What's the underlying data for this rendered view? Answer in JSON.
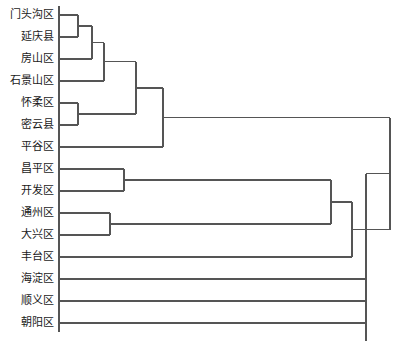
{
  "chart_data": {
    "type": "dendrogram",
    "title": "",
    "subtitle": "",
    "xlabel": "",
    "ylabel": "",
    "orientation": "horizontal-leaves-left",
    "grid": false,
    "legend": null,
    "axis_visible": false,
    "line_color": "#555555",
    "background_color": "#ffffff",
    "leaf_count": 15,
    "leaves": [
      {
        "index": 0,
        "label": "门头沟区",
        "y": 15
      },
      {
        "index": 1,
        "label": "延庆县",
        "y": 37
      },
      {
        "index": 2,
        "label": "房山区",
        "y": 59
      },
      {
        "index": 3,
        "label": "石景山区",
        "y": 81
      },
      {
        "index": 4,
        "label": "怀柔区",
        "y": 103
      },
      {
        "index": 5,
        "label": "密云县",
        "y": 125
      },
      {
        "index": 6,
        "label": "平谷区",
        "y": 147
      },
      {
        "index": 7,
        "label": "昌平区",
        "y": 169
      },
      {
        "index": 8,
        "label": "开发区",
        "y": 191
      },
      {
        "index": 9,
        "label": "通州区",
        "y": 213
      },
      {
        "index": 10,
        "label": "大兴区",
        "y": 235
      },
      {
        "index": 11,
        "label": "丰台区",
        "y": 257
      },
      {
        "index": 12,
        "label": "海淀区",
        "y": 279
      },
      {
        "index": 13,
        "label": "顺义区",
        "y": 301
      },
      {
        "index": 14,
        "label": "朝阳区",
        "y": 323
      },
      {
        "index": 15,
        "label": "西城区",
        "y": 345
      },
      {
        "index": 16,
        "label": "东城区",
        "y": 367
      }
    ],
    "leaf_x": 59,
    "merges": [
      {
        "id": "m1",
        "label": "门头沟区 + 延庆县",
        "x": 78,
        "y1": 15,
        "y2": 37
      },
      {
        "id": "m2",
        "label": "m1 + 房山区",
        "x": 92,
        "y1": 26,
        "y2": 59
      },
      {
        "id": "m3",
        "label": "怀柔区 + 密云县",
        "x": 78,
        "y1": 103,
        "y2": 125
      },
      {
        "id": "m4",
        "label": "m2 + 石景山区",
        "x": 104,
        "y1": 42.5,
        "y2": 81
      },
      {
        "id": "m5",
        "label": "m4 + m3",
        "x": 136,
        "y1": 61.75,
        "y2": 114
      },
      {
        "id": "m6",
        "label": "m5 + 平谷区",
        "x": 163,
        "y1": 87.9,
        "y2": 147
      },
      {
        "id": "m7",
        "label": "昌平区 + 开发区",
        "x": 124,
        "y1": 169,
        "y2": 191
      },
      {
        "id": "m8",
        "label": "通州区 + 大兴区",
        "x": 110,
        "y1": 213,
        "y2": 235
      },
      {
        "id": "m9",
        "label": "m7 + m8",
        "x": 331,
        "y1": 180,
        "y2": 224
      },
      {
        "id": "m10",
        "label": "m9 + 丰台区",
        "x": 352,
        "y1": 202,
        "y2": 257
      },
      {
        "id": "m11",
        "label": "m6 + m10",
        "x": 390,
        "y1": 117.5,
        "y2": 229.5
      },
      {
        "id": "m12",
        "label": "m11 + 海淀区",
        "x": 366,
        "y1": 173.5,
        "y2": 279
      },
      {
        "id": "m13",
        "label": "m12 + 顺义区",
        "x": 366,
        "y1": 226,
        "y2": 301
      },
      {
        "id": "m14",
        "label": "m13 + 朝阳区",
        "x": 366,
        "y1": 263,
        "y2": 323
      },
      {
        "id": "m15",
        "label": "m14 + 西城区",
        "x": 366,
        "y1": 293,
        "y2": 345
      },
      {
        "id": "m16",
        "label": "m15 + 东城区",
        "x": 366,
        "y1": 319,
        "y2": 367
      }
    ]
  }
}
